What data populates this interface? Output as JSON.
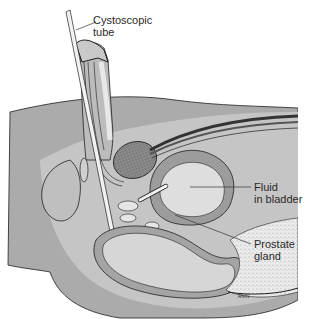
{
  "figure": {
    "type": "anatomical-illustration",
    "colors": {
      "background": "#ffffff",
      "body_outer": "#a9a9a9",
      "body_mid": "#c4c4c4",
      "body_light": "#d9d9d9",
      "bladder_wall": "#9a9a9a",
      "fluid": "#dedede",
      "outline": "#1e1e1e",
      "stippled_tissue": "#eaeaea"
    }
  },
  "labels": {
    "tube": {
      "line1": "Cystoscopic",
      "line2": "tube"
    },
    "fluid": {
      "line1": "Fluid",
      "line2": "in bladder"
    },
    "prostate": {
      "line1": "Prostate",
      "line2": "gland"
    }
  },
  "signature": "RMN"
}
